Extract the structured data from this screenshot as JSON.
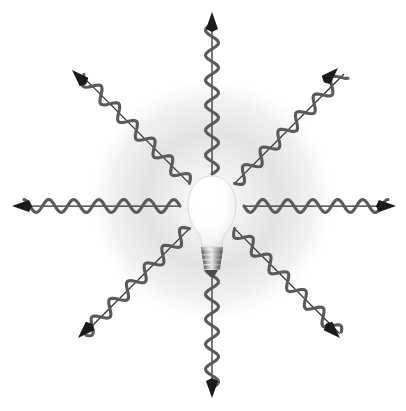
{
  "figure": {
    "background_color": "#ffffff",
    "canvas": {
      "width": 406,
      "height": 411
    }
  },
  "bulb": {
    "name": "light-bulb",
    "center_x": 212,
    "center_y": 206,
    "glass": {
      "label": "bulb-glass",
      "cx": 212,
      "cy": 207,
      "rx": 23,
      "ry": 30,
      "neck_top_y": 232,
      "neck_bottom_y": 248,
      "neck_half_width_top": 17,
      "neck_half_width_bottom": 11,
      "fill_bright": "#ffffff",
      "fill_edge": "#e8e8e8",
      "outline_color": "#cfcfcf"
    },
    "screw_base": {
      "label": "screw-base",
      "top_y": 248,
      "bottom_y": 270,
      "half_width_top": 11,
      "half_width_bottom": 7,
      "ridge_count": 4,
      "fill_light": "#efefef",
      "fill_mid": "#a8a8a8",
      "fill_dark": "#6a6a6a",
      "tip_color": "#4a4a4a"
    },
    "glow": {
      "label": "glow-halo",
      "cx": 212,
      "cy": 200,
      "radius": 128,
      "inner_color": "#ffffff",
      "mid_color": "#e2e2e2",
      "outer_color": "#ffffff"
    }
  },
  "rays": {
    "count": 8,
    "start_radius": 32,
    "wave": {
      "amplitude": 6.5,
      "period": 25,
      "stroke_color": "#5a5a5a",
      "stroke_width": 3.1
    },
    "axis_line": {
      "stroke_color": "#2e2e2e",
      "stroke_width": 1.25
    },
    "arrowhead": {
      "color": "#1a1a1a",
      "length": 17,
      "half_width": 6
    },
    "items": [
      {
        "name": "ray-up",
        "angle_deg": -90,
        "length": 190,
        "tip_x": 212,
        "tip_y": 12
      },
      {
        "name": "ray-up-right",
        "angle_deg": -45,
        "length": 196,
        "tip_x": 338,
        "tip_y": 68
      },
      {
        "name": "ray-right",
        "angle_deg": 0,
        "length": 186,
        "tip_x": 396,
        "tip_y": 206
      },
      {
        "name": "ray-down-right",
        "angle_deg": 45,
        "length": 190,
        "tip_x": 340,
        "tip_y": 338
      },
      {
        "name": "ray-down",
        "angle_deg": 90,
        "length": 192,
        "tip_x": 212,
        "tip_y": 398
      },
      {
        "name": "ray-down-left",
        "angle_deg": 135,
        "length": 190,
        "tip_x": 78,
        "tip_y": 338
      },
      {
        "name": "ray-left",
        "angle_deg": 180,
        "length": 198,
        "tip_x": 12,
        "tip_y": 206
      },
      {
        "name": "ray-up-left",
        "angle_deg": -135,
        "length": 194,
        "tip_x": 72,
        "tip_y": 70
      }
    ]
  }
}
